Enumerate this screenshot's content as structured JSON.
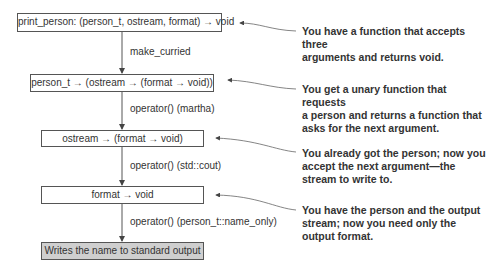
{
  "diagram": {
    "boxes": [
      {
        "id": "print-person",
        "text": "print_person: (person_t, ostream, format) → void"
      },
      {
        "id": "curried-person",
        "text": "person_t → (ostream → (format → void))"
      },
      {
        "id": "ostream-fn",
        "text": "ostream → (format → void)"
      },
      {
        "id": "format-fn",
        "text": "format → void"
      },
      {
        "id": "result",
        "text": "Writes the name to standard output"
      }
    ],
    "edges": [
      {
        "from": "print-person",
        "to": "curried-person",
        "label": "make_curried"
      },
      {
        "from": "curried-person",
        "to": "ostream-fn",
        "label": "operator() (martha)"
      },
      {
        "from": "ostream-fn",
        "to": "format-fn",
        "label": "operator() (std::cout)"
      },
      {
        "from": "format-fn",
        "to": "result",
        "label": "operator() (person_t::name_only)"
      }
    ],
    "annotations": [
      {
        "target": "print-person",
        "lines": [
          "You have a function that accepts three",
          "arguments and returns void."
        ]
      },
      {
        "target": "curried-person",
        "lines": [
          "You get a unary function that requests",
          "a person and returns a function that",
          "asks for the next argument."
        ]
      },
      {
        "target": "ostream-fn",
        "lines": [
          "You already got the person; now you",
          "accept the next argument—the",
          "stream to write to."
        ]
      },
      {
        "target": "format-fn",
        "lines": [
          "You have the person and the output",
          "stream; now you need only the",
          "output format."
        ]
      }
    ],
    "colors": {
      "stroke": "#555555",
      "result_fill": "#cfcfcf",
      "text": "#333333"
    }
  }
}
